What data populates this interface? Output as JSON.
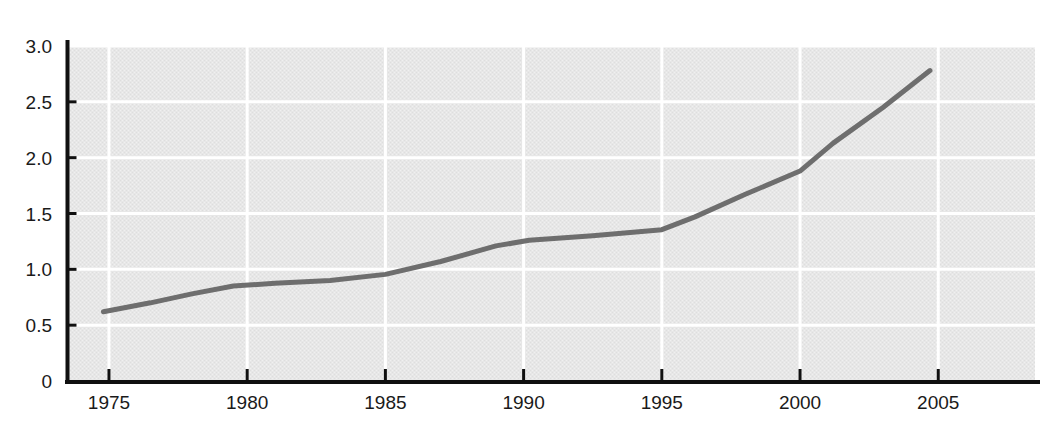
{
  "chart_data": {
    "type": "line",
    "title": "",
    "subtitle": "",
    "xlabel": "",
    "ylabel": "",
    "x": [
      1975,
      1980,
      1985,
      1990,
      1995,
      2000,
      2005
    ],
    "series": [
      {
        "name": "series-1",
        "values": [
          0.62,
          0.86,
          0.96,
          1.25,
          1.35,
          1.88,
          2.78
        ],
        "color": "#6e6e6e"
      }
    ],
    "points": [
      {
        "x": 1974.8,
        "y": 0.62
      },
      {
        "x": 1976.5,
        "y": 0.7
      },
      {
        "x": 1978.0,
        "y": 0.78
      },
      {
        "x": 1979.5,
        "y": 0.85
      },
      {
        "x": 1981.0,
        "y": 0.875
      },
      {
        "x": 1983.0,
        "y": 0.9
      },
      {
        "x": 1985.0,
        "y": 0.955
      },
      {
        "x": 1987.0,
        "y": 1.07
      },
      {
        "x": 1989.0,
        "y": 1.21
      },
      {
        "x": 1990.2,
        "y": 1.26
      },
      {
        "x": 1992.5,
        "y": 1.3
      },
      {
        "x": 1995.0,
        "y": 1.355
      },
      {
        "x": 1996.2,
        "y": 1.47
      },
      {
        "x": 1998.0,
        "y": 1.67
      },
      {
        "x": 2000.0,
        "y": 1.88
      },
      {
        "x": 2001.2,
        "y": 2.13
      },
      {
        "x": 2003.0,
        "y": 2.45
      },
      {
        "x": 2004.7,
        "y": 2.78
      }
    ],
    "xlim": [
      1973.5,
      2008.5
    ],
    "ylim": [
      0,
      3.0
    ],
    "ytick_values": [
      0,
      0.5,
      1.0,
      1.5,
      2.0,
      2.5,
      3.0
    ],
    "ytick_labels": [
      "0",
      "0.5",
      "1.0",
      "1.5",
      "2.0",
      "2.5",
      "3.0"
    ],
    "xtick_values": [
      1975,
      1980,
      1985,
      1990,
      1995,
      2000,
      2005
    ],
    "xtick_labels": [
      "1975",
      "1980",
      "1985",
      "1990",
      "1995",
      "2000",
      "2005"
    ],
    "grid": {
      "horizontal": true,
      "vertical": true,
      "color": "#ffffff"
    },
    "legend": null,
    "plot_background": "#e6e6e6",
    "axis_color": "#101010"
  }
}
